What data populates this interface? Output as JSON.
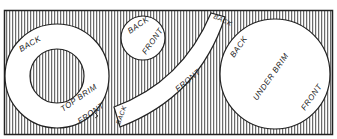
{
  "diagram": {
    "pieces": [
      {
        "name": "top-brim",
        "labels": {
          "back": "BACK",
          "title": "TOP BRIM",
          "front": "FRONT"
        }
      },
      {
        "name": "crown-top",
        "labels": {
          "back": "BACK",
          "front": "FRONT"
        }
      },
      {
        "name": "side-band",
        "labels": {
          "back_top": "BACK",
          "front": "FRONT",
          "back_bottom": "BACK"
        }
      },
      {
        "name": "under-brim",
        "labels": {
          "back": "BACK",
          "title": "UNDER BRIM",
          "front": "FRONT"
        }
      }
    ],
    "colors": {
      "ink": "#222222",
      "paper": "#ffffff"
    }
  }
}
